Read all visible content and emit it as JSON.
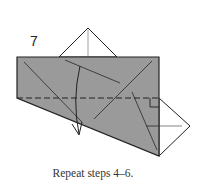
{
  "diagram": {
    "step_number": "7",
    "caption": "Repeat steps 4–6.",
    "colors": {
      "paper": "#9a9a9a",
      "line": "#222222",
      "crease": "#444444",
      "background": "#ffffff"
    }
  }
}
